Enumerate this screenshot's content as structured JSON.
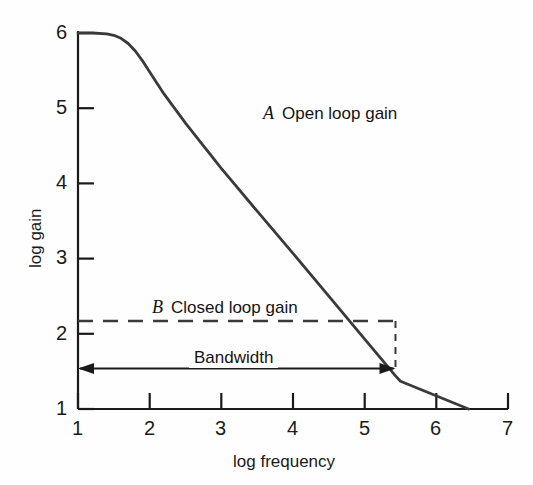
{
  "chart_data": {
    "type": "line",
    "title": "",
    "xlabel": "log frequency",
    "ylabel": "log gain",
    "xlim": [
      1,
      7
    ],
    "ylim": [
      1,
      6
    ],
    "xticks": [
      "1",
      "2",
      "3",
      "4",
      "5",
      "6",
      "7"
    ],
    "yticks": [
      "1",
      "2",
      "3",
      "4",
      "5",
      "6"
    ],
    "grid": false,
    "legend_position": "inline-annotation",
    "series": [
      {
        "name": "A  Open loop gain",
        "key": "A",
        "label": "Open loop gain",
        "style": "solid",
        "color": "#3a3a3a",
        "x": [
          1.0,
          1.2,
          1.4,
          1.5,
          1.6,
          1.7,
          1.8,
          1.9,
          2.0,
          2.2,
          2.5,
          3.0,
          3.5,
          4.0,
          4.5,
          5.0,
          5.43,
          5.5,
          6.0,
          6.45
        ],
        "y": [
          6.0,
          6.0,
          5.99,
          5.97,
          5.93,
          5.86,
          5.76,
          5.63,
          5.48,
          5.19,
          4.8,
          4.2,
          3.63,
          3.07,
          2.5,
          1.93,
          1.44,
          1.37,
          0.8,
          1.0
        ],
        "description": "Flat at log gain 6 until about log frequency 1.5, then rolls off linearly at constant slope, crossing log gain 1 near log frequency 6.45"
      },
      {
        "name": "B  Closed loop gain",
        "key": "B",
        "label": "Closed loop gain",
        "style": "dashed",
        "color": "#3a3a3a",
        "x": [
          1.0,
          5.43
        ],
        "y": [
          2.17,
          2.17
        ],
        "description": "Horizontal dashed line at log gain 2.17 from log frequency 1 to the intersection with the open loop gain at log frequency 5.43"
      }
    ],
    "annotations": [
      {
        "name": "bandwidth",
        "label": "Bandwidth",
        "type": "double-arrow",
        "x_start": 1.0,
        "x_end": 5.43,
        "y": 1.54
      },
      {
        "name": "intersection-drop",
        "type": "dashed-vertical",
        "x": 5.43,
        "y_start": 2.17,
        "y_end": 1.54
      }
    ]
  },
  "axes": {
    "x_title": "log frequency",
    "y_title": "log gain"
  },
  "labels": {
    "series_a_key": "A",
    "series_a_text": "Open loop gain",
    "series_b_key": "B",
    "series_b_text": "Closed loop gain",
    "bandwidth": "Bandwidth"
  },
  "xtick_labels": [
    "1",
    "2",
    "3",
    "4",
    "5",
    "6",
    "7"
  ],
  "ytick_labels": [
    "6",
    "5",
    "4",
    "3",
    "2",
    "1"
  ],
  "colors": {
    "axis": "#1a1a1a",
    "curve": "#3a3a3a",
    "background": "#fefefe"
  }
}
